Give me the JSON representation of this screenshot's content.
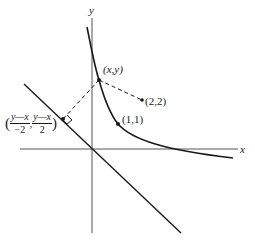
{
  "diagram": {
    "axes": {
      "x_label": "x",
      "y_label": "y"
    },
    "curve": {
      "description": "decreasing curve in first quadrant (hyperbola-like)"
    },
    "line": {
      "description": "diagonal line y = -x through origin"
    },
    "points": [
      {
        "id": "point-xy",
        "label": "(x,y)"
      },
      {
        "id": "point-2-2",
        "label": "(2,2)"
      },
      {
        "id": "point-1-1",
        "label": "(1,1)"
      },
      {
        "id": "point-foot",
        "label_parts": {
          "open": "(",
          "frac1_num": "y—x",
          "frac1_den": "−2",
          "sep": ",",
          "frac2_num": "y—x",
          "frac2_den": "2",
          "close": ")"
        }
      }
    ],
    "colors": {
      "ink": "#1a1a1a",
      "axis": "#555555",
      "background": "#ffffff"
    }
  }
}
